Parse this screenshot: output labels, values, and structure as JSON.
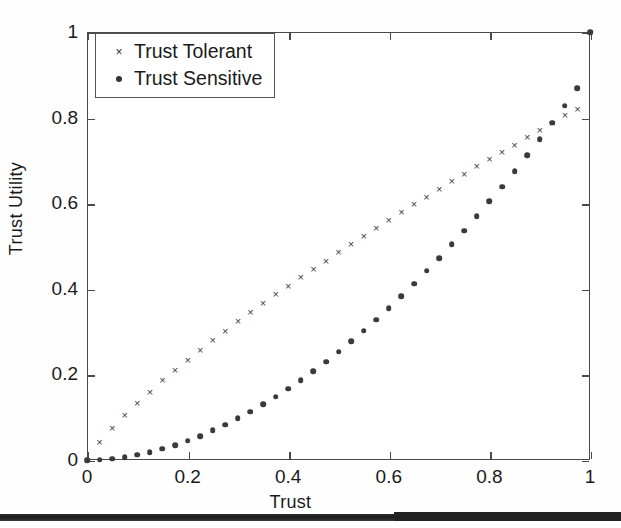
{
  "figure": {
    "background": "#fefefe",
    "plot_border_color": "#4a4a4a",
    "marker_color": "#3a3a3a"
  },
  "axes": {
    "x_label": "Trust",
    "y_label": "Trust Utility",
    "x_ticks": [
      "0",
      "0.2",
      "0.4",
      "0.6",
      "0.8",
      "1"
    ],
    "y_ticks": [
      "0",
      "0.2",
      "0.4",
      "0.6",
      "0.8",
      "1"
    ]
  },
  "legend": {
    "entries": [
      {
        "symbol": "cross",
        "symbol_glyph": "×",
        "label": "Trust Tolerant"
      },
      {
        "symbol": "dot",
        "symbol_glyph": "•",
        "label": "Trust Sensitive"
      }
    ]
  },
  "chart_data": {
    "type": "scatter",
    "title": "",
    "xlabel": "Trust",
    "ylabel": "Trust Utility",
    "xlim": [
      0,
      1
    ],
    "ylim": [
      0,
      1
    ],
    "grid": false,
    "legend_position": "top-left",
    "x": [
      0.0,
      0.025,
      0.05,
      0.075,
      0.1,
      0.125,
      0.15,
      0.175,
      0.2,
      0.225,
      0.25,
      0.275,
      0.3,
      0.325,
      0.35,
      0.375,
      0.4,
      0.425,
      0.45,
      0.475,
      0.5,
      0.525,
      0.55,
      0.575,
      0.6,
      0.625,
      0.65,
      0.675,
      0.7,
      0.725,
      0.75,
      0.775,
      0.8,
      0.825,
      0.85,
      0.875,
      0.9,
      0.925,
      0.95,
      0.975,
      1.0
    ],
    "series": [
      {
        "name": "Trust Tolerant",
        "marker": "x",
        "values": [
          0.0,
          0.042,
          0.075,
          0.105,
          0.133,
          0.16,
          0.186,
          0.21,
          0.234,
          0.257,
          0.28,
          0.302,
          0.324,
          0.345,
          0.366,
          0.387,
          0.407,
          0.427,
          0.447,
          0.466,
          0.486,
          0.505,
          0.524,
          0.542,
          0.561,
          0.579,
          0.597,
          0.615,
          0.633,
          0.651,
          0.668,
          0.686,
          0.703,
          0.72,
          0.737,
          0.754,
          0.771,
          0.788,
          0.805,
          0.821,
          1.0
        ]
      },
      {
        "name": "Trust Sensitive",
        "marker": "o",
        "values": [
          0.0,
          0.001,
          0.003,
          0.007,
          0.012,
          0.018,
          0.026,
          0.035,
          0.045,
          0.056,
          0.069,
          0.082,
          0.097,
          0.113,
          0.13,
          0.148,
          0.167,
          0.187,
          0.208,
          0.23,
          0.253,
          0.277,
          0.302,
          0.328,
          0.355,
          0.383,
          0.412,
          0.442,
          0.472,
          0.504,
          0.536,
          0.57,
          0.604,
          0.639,
          0.675,
          0.712,
          0.75,
          0.788,
          0.828,
          0.868,
          1.0
        ]
      }
    ]
  }
}
